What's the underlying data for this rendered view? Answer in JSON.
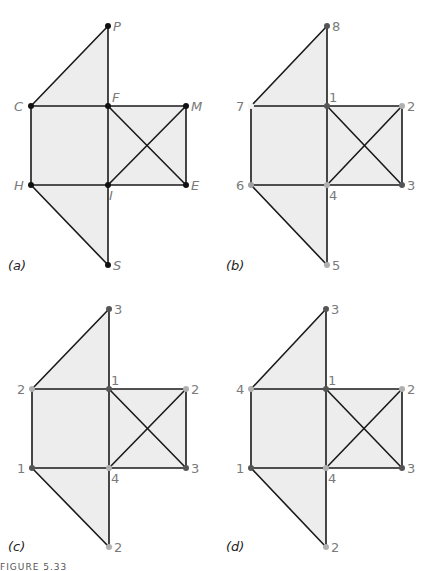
{
  "figure": {
    "caption": "FIGURE 5.33",
    "colors": {
      "face_fill": "#ededed",
      "edge": "#1a1a1a",
      "label": "#7a7a7a",
      "vertex_black": "#111111",
      "vertex_dark": "#555555",
      "vertex_light": "#b0b0b0",
      "vertex_white": "#f4f4f4"
    },
    "panels": [
      {
        "id": "a",
        "label": "(a)",
        "italic_vertex_labels": true,
        "vertices": [
          {
            "key": "P",
            "label": "P",
            "color": "black"
          },
          {
            "key": "C",
            "label": "C",
            "color": "black"
          },
          {
            "key": "F",
            "label": "F",
            "color": "black"
          },
          {
            "key": "M",
            "label": "M",
            "color": "black"
          },
          {
            "key": "H",
            "label": "H",
            "color": "black"
          },
          {
            "key": "I",
            "label": "I",
            "color": "black"
          },
          {
            "key": "E",
            "label": "E",
            "color": "black"
          },
          {
            "key": "S",
            "label": "S",
            "color": "black"
          }
        ]
      },
      {
        "id": "b",
        "label": "(b)",
        "italic_vertex_labels": false,
        "vertices": [
          {
            "key": "P",
            "label": "8",
            "color": "dark"
          },
          {
            "key": "C",
            "label": "7",
            "color": "white"
          },
          {
            "key": "F",
            "label": "1",
            "color": "dark"
          },
          {
            "key": "M",
            "label": "2",
            "color": "light"
          },
          {
            "key": "H",
            "label": "6",
            "color": "light"
          },
          {
            "key": "I",
            "label": "4",
            "color": "light"
          },
          {
            "key": "E",
            "label": "3",
            "color": "dark"
          },
          {
            "key": "S",
            "label": "5",
            "color": "light"
          }
        ]
      },
      {
        "id": "c",
        "label": "(c)",
        "italic_vertex_labels": false,
        "vertices": [
          {
            "key": "P",
            "label": "3",
            "color": "dark"
          },
          {
            "key": "C",
            "label": "2",
            "color": "light"
          },
          {
            "key": "F",
            "label": "1",
            "color": "dark"
          },
          {
            "key": "M",
            "label": "2",
            "color": "light"
          },
          {
            "key": "H",
            "label": "1",
            "color": "dark"
          },
          {
            "key": "I",
            "label": "4",
            "color": "light"
          },
          {
            "key": "E",
            "label": "3",
            "color": "dark"
          },
          {
            "key": "S",
            "label": "2",
            "color": "light"
          }
        ]
      },
      {
        "id": "d",
        "label": "(d)",
        "italic_vertex_labels": false,
        "vertices": [
          {
            "key": "P",
            "label": "3",
            "color": "dark"
          },
          {
            "key": "C",
            "label": "4",
            "color": "light"
          },
          {
            "key": "F",
            "label": "1",
            "color": "dark"
          },
          {
            "key": "M",
            "label": "2",
            "color": "light"
          },
          {
            "key": "H",
            "label": "1",
            "color": "dark"
          },
          {
            "key": "I",
            "label": "4",
            "color": "light"
          },
          {
            "key": "E",
            "label": "3",
            "color": "dark"
          },
          {
            "key": "S",
            "label": "2",
            "color": "light"
          }
        ]
      }
    ],
    "graph": {
      "edges": [
        [
          "C",
          "P"
        ],
        [
          "P",
          "F"
        ],
        [
          "C",
          "F"
        ],
        [
          "F",
          "M"
        ],
        [
          "C",
          "H"
        ],
        [
          "F",
          "I"
        ],
        [
          "M",
          "E"
        ],
        [
          "H",
          "I"
        ],
        [
          "I",
          "E"
        ],
        [
          "F",
          "E"
        ],
        [
          "I",
          "M"
        ],
        [
          "H",
          "S"
        ],
        [
          "I",
          "S"
        ]
      ],
      "faces": [
        [
          "C",
          "P",
          "F"
        ],
        [
          "C",
          "F",
          "I",
          "H"
        ],
        [
          "F",
          "M",
          "E",
          "I"
        ],
        [
          "H",
          "I",
          "S"
        ]
      ]
    }
  }
}
